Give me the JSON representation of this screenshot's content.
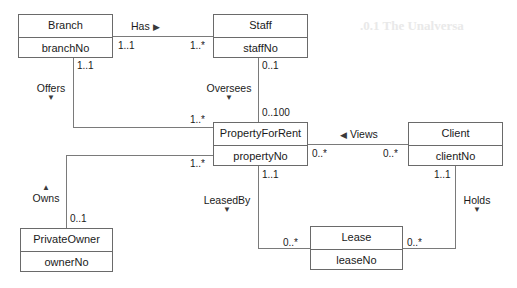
{
  "diagram": {
    "background_color": "#ffffff",
    "line_color": "#7a7a7a",
    "text_color": "#1a1a1a",
    "entities": [
      {
        "id": "branch",
        "name": "Branch",
        "attribute": "branchNo"
      },
      {
        "id": "staff",
        "name": "Staff",
        "attribute": "staffNo"
      },
      {
        "id": "propertyforrent",
        "name": "PropertyForRent",
        "attribute": "propertyNo"
      },
      {
        "id": "client",
        "name": "Client",
        "attribute": "clientNo"
      },
      {
        "id": "privateowner",
        "name": "PrivateOwner",
        "attribute": "ownerNo"
      },
      {
        "id": "lease",
        "name": "Lease",
        "attribute": "leaseNo"
      }
    ],
    "relationships": [
      {
        "id": "has",
        "label": "Has",
        "marker": "right",
        "from": "Branch",
        "to": "Staff",
        "from_mult": "1..1",
        "to_mult": "1..*"
      },
      {
        "id": "offers",
        "label": "Offers",
        "marker": "down",
        "from": "Branch",
        "to": "PropertyForRent",
        "from_mult": "1..1",
        "to_mult": "1..*"
      },
      {
        "id": "oversees",
        "label": "Oversees",
        "marker": "down",
        "from": "Staff",
        "to": "PropertyForRent",
        "from_mult": "0..1",
        "to_mult": "0..100"
      },
      {
        "id": "views",
        "label": "Views",
        "marker": "left",
        "from": "PropertyForRent",
        "to": "Client",
        "from_mult": "0..*",
        "to_mult": "0..*"
      },
      {
        "id": "owns",
        "label": "Owns",
        "marker": "up",
        "from": "PrivateOwner",
        "to": "PropertyForRent",
        "from_mult": "0..1",
        "to_mult": "1..*"
      },
      {
        "id": "leasedby",
        "label": "LeasedBy",
        "marker": "down",
        "from": "PropertyForRent",
        "to": "Lease",
        "from_mult": "1..1",
        "to_mult": "0..*"
      },
      {
        "id": "holds",
        "label": "Holds",
        "marker": "down",
        "from": "Client",
        "to": "Lease",
        "from_mult": "1..1",
        "to_mult": "0..*"
      }
    ],
    "markers": {
      "right": "▶",
      "left": "◀",
      "down": "▼",
      "up": "▲"
    },
    "multiplicity_labels": {
      "branch_has": "1..1",
      "staff_has": "1..*",
      "branch_offers": "1..1",
      "property_offers": "1..*",
      "staff_oversees": "0..1",
      "property_oversees": "0..100",
      "property_views": "0..*",
      "client_views": "0..*",
      "property_owns": "1..*",
      "owner_owns": "0..1",
      "property_leasedby": "1..1",
      "lease_leasedby": "0..*",
      "client_holds": "1..1",
      "lease_holds": "0..*"
    }
  }
}
